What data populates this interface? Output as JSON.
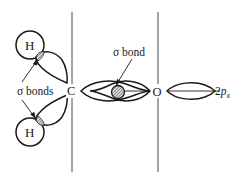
{
  "diagram": {
    "title": "",
    "atoms": {
      "h_top": "H",
      "h_bottom": "H",
      "carbon": "C",
      "oxygen": "O"
    },
    "labels": {
      "sigma_bonds": "σ bonds",
      "sigma_bond": "σ bond",
      "orbital_2px_prefix": "2",
      "orbital_2px_p": "p",
      "orbital_2px_sub": "x"
    },
    "colors": {
      "stroke": "#1a1a1a",
      "hatch_fill": "#b0b0b0",
      "background": "#ffffff"
    }
  }
}
